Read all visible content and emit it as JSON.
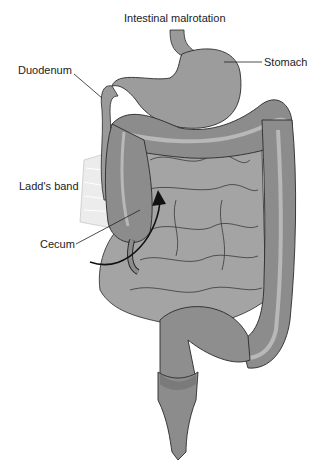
{
  "title": "Intestinal malrotation",
  "labels": {
    "stomach": "Stomach",
    "duodenum": "Duodenum",
    "ladds_band": "Ladd's band",
    "cecum": "Cecum",
    "small_intestine_line1": "Small",
    "small_intestine_line2": "intestine"
  },
  "colors": {
    "organ": "#9a9a9a",
    "organ_dark": "#7f7f7f",
    "stripe": "#b5b5b5",
    "outline": "#2a2a2a",
    "band": "#e6e6e6"
  }
}
